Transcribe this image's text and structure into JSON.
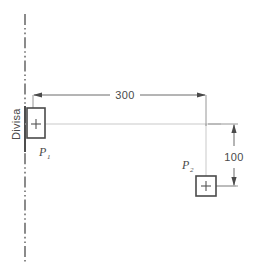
{
  "drawing": {
    "title": "Divisa Dimension Diagram",
    "boundary_label": "Divisa",
    "units_note": "",
    "colors": {
      "boundary_line": "#4d4d4d",
      "box_stroke": "#4a4a4a",
      "dimension_line": "#6b6b6b",
      "construction_line": "#c9c9c9",
      "text": "#4a4a4a",
      "background": "#ffffff"
    }
  },
  "points": [
    {
      "id": "P1",
      "label": "P",
      "subscript": "1",
      "shape": "rectangle",
      "marker": "crosshair"
    },
    {
      "id": "P2",
      "label": "P",
      "subscript": "2",
      "shape": "square",
      "marker": "crosshair"
    }
  ],
  "dimensions": [
    {
      "id": "horizontal",
      "value": "300",
      "orientation": "horizontal",
      "from": "Divisa",
      "to": "P2"
    },
    {
      "id": "vertical",
      "value": "100",
      "orientation": "vertical",
      "from": "P1",
      "to": "P2"
    }
  ]
}
